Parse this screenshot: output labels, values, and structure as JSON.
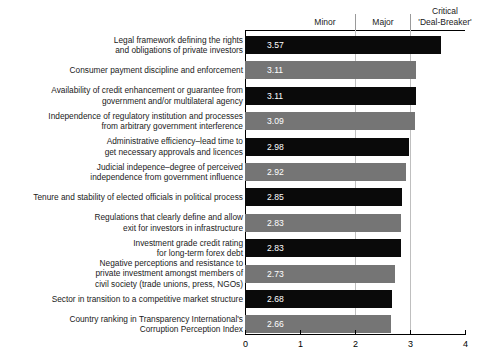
{
  "chart_data": {
    "type": "bar",
    "orientation": "horizontal",
    "title": "",
    "xlabel": "",
    "ylabel": "",
    "xlim": [
      0,
      4
    ],
    "xticks": [
      "0",
      "1",
      "2",
      "3",
      "4"
    ],
    "grid": true,
    "gridlines_at": [
      2,
      3
    ],
    "legend": "none",
    "band_labels": [
      {
        "text": "Minor",
        "center_value": 1.45
      },
      {
        "text": "Major",
        "center_value": 2.5
      },
      {
        "text": "Critical\n'Deal-Breaker'",
        "center_value": 3.5
      }
    ],
    "categories": [
      "Legal framework defining the rights\nand obligations of private investors",
      "Consumer payment discipline and enforcement",
      "Availability of credit enhancement or guarantee from\ngovernment and/or multilateral agency",
      "Independence of regulatory institution and processes\nfrom arbitrary government interference",
      "Administrative efficiency–lead time to\nget necessary approvals and licences",
      "Judicial indepence–degree of perceived\nindependence from government influence",
      "Tenure and stability of elected officials in political process",
      "Regulations that clearly define and allow\nexit for investors in infrastructure",
      "Investment grade credit rating\nfor long-term forex debt",
      "Negative perceptions and resistance to\nprivate investment amongst members of\ncivil society (trade unions, press, NGOs)",
      "Sector in transition to a competitive market structure",
      "Country ranking in Transparency International's\nCorruption Perception Index"
    ],
    "values": [
      3.57,
      3.11,
      3.11,
      3.09,
      2.98,
      2.92,
      2.85,
      2.83,
      2.83,
      2.73,
      2.68,
      2.66
    ],
    "value_labels": [
      "3.57",
      "3.11",
      "3.11",
      "3.09",
      "2.98",
      "2.92",
      "2.85",
      "2.83",
      "2.83",
      "2.73",
      "2.68",
      "2.66"
    ],
    "bar_colors": [
      "dark",
      "light",
      "dark",
      "light",
      "dark",
      "light",
      "dark",
      "light",
      "dark",
      "light",
      "dark",
      "light"
    ],
    "colors": {
      "dark_bar": "#0a0a0a",
      "light_bar": "#757575",
      "gridline": "#bfbfbf",
      "axis": "#000000",
      "value_text": "#ffffff",
      "label_text": "#1a1a1a",
      "background": "#ffffff"
    }
  }
}
